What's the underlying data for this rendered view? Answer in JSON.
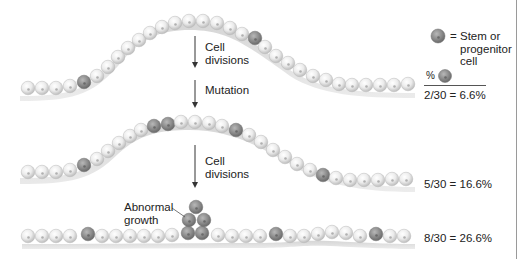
{
  "diagram": {
    "steps": [
      {
        "id": "cell-divisions-1",
        "label_line1": "Cell",
        "label_line2": "divisions"
      },
      {
        "id": "mutation",
        "label_line1": "Mutation"
      },
      {
        "id": "cell-divisions-2",
        "label_line1": "Cell",
        "label_line2": "divisions"
      }
    ],
    "annotation": {
      "label_line1": "Abnormal",
      "label_line2": "growth"
    },
    "legend": {
      "symbol": "dark-gray-cell",
      "eq": "=",
      "line1": "Stem or",
      "line2": "progenitor",
      "line3": "cell",
      "percent_header": "%"
    },
    "rows": [
      {
        "name": "initial-epithelium",
        "stem_count": 2,
        "total": 30,
        "ratio_text": "2/30 = 6.6%"
      },
      {
        "name": "after-mutation",
        "stem_count": 5,
        "total": 30,
        "ratio_text": "5/30 = 16.6%"
      },
      {
        "name": "abnormal-growth",
        "stem_count": 8,
        "total": 30,
        "ratio_text": "8/30 = 26.6%"
      }
    ],
    "colors": {
      "normal_cell": "#e6e6e6",
      "normal_cell_highlight": "#ffffff",
      "stem_cell": "#8a8a8a",
      "stem_cell_highlight": "#b5b5b5",
      "membrane": "#d8d8d8",
      "text": "#222222"
    }
  }
}
